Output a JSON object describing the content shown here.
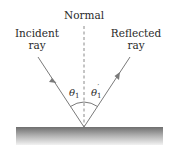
{
  "diagram": {
    "labels": {
      "normal": "Normal",
      "incident_line1": "Incident",
      "incident_line2": "ray",
      "reflected_line1": "Reflected",
      "reflected_line2": "ray",
      "angle_incident": "θ",
      "angle_incident_sub": "1",
      "angle_reflected": "θ",
      "angle_reflected_sub": "1",
      "angle_reflected_prime": "′"
    },
    "colors": {
      "ray": "#7a7a7a",
      "normal": "#8a8a8a",
      "surface_top": "#6e6e6e",
      "surface_bottom": "#f2f2f2",
      "text": "#2a2a2a"
    }
  }
}
